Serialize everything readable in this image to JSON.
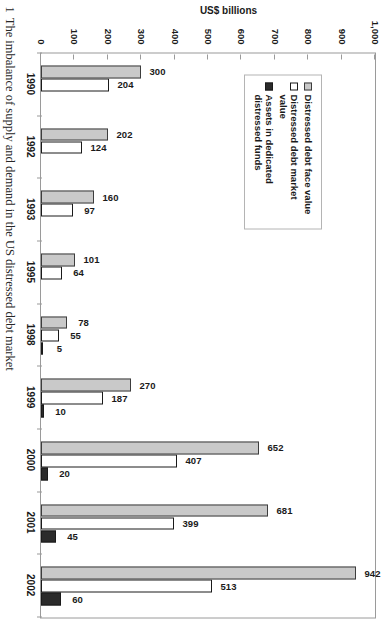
{
  "figure": {
    "number": "1",
    "caption": "The imbalance of supply and demand in the US distressed debt market"
  },
  "chart_data": {
    "type": "bar",
    "title": "",
    "xlabel": "",
    "ylabel": "US$ billions",
    "ylim": [
      0,
      1000
    ],
    "yticks": [
      "0",
      "100",
      "200",
      "300",
      "400",
      "500",
      "600",
      "700",
      "800",
      "900",
      "1,000"
    ],
    "grid": false,
    "orientation": "vertical",
    "legend_position": "upper-left-inside",
    "categories": [
      "1990",
      "1992",
      "1993",
      "1995",
      "1998",
      "1999",
      "2000",
      "2001",
      "2002"
    ],
    "series": [
      {
        "name": "Distressed debt face value",
        "color": "#c9c9c9",
        "values": [
          300,
          202,
          160,
          101,
          78,
          270,
          652,
          681,
          942
        ]
      },
      {
        "name": "Distressed debt market value",
        "color": "#ffffff",
        "values": [
          204,
          124,
          97,
          64,
          55,
          187,
          407,
          399,
          513
        ]
      },
      {
        "name": "Assets in dedicated distressed funds",
        "color": "#2b2b2b",
        "values": [
          null,
          null,
          null,
          null,
          5,
          10,
          20,
          45,
          60
        ]
      }
    ],
    "data_labels": {
      "1990": [
        "300",
        "204",
        ""
      ],
      "1992": [
        "202",
        "124",
        ""
      ],
      "1993": [
        "160",
        "97",
        ""
      ],
      "1995": [
        "101",
        "64",
        ""
      ],
      "1998": [
        "78",
        "55",
        "5"
      ],
      "1999": [
        "270",
        "187",
        "10"
      ],
      "2000": [
        "652",
        "407",
        "20"
      ],
      "2001": [
        "681",
        "399",
        "45"
      ],
      "2002": [
        "942",
        "513",
        "60"
      ]
    }
  },
  "legend": {
    "items": [
      {
        "label": "Distressed debt face value",
        "swatch": "s0"
      },
      {
        "label": "Distressed debt market value",
        "swatch": "s1"
      },
      {
        "label": "Assets in dedicated distressed funds",
        "swatch": "s2"
      }
    ]
  }
}
